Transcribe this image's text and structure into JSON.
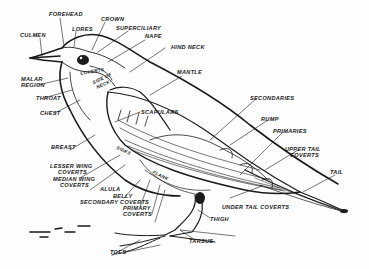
{
  "diagram": {
    "title": "",
    "line_color": "#1a1a1a",
    "background": "#fefefe",
    "labels": {
      "forehead": "FOREHEAD",
      "lores": "LORES",
      "crown": "CROWN",
      "culmen": "CULMEN",
      "superciliary": "SUPERCILIARY",
      "nape": "NAPE",
      "hind_neck": "HIND NECK",
      "ear_coverts": "COVERTS",
      "side_of_neck_1": "SIDE OF",
      "side_of_neck_2": "NECK",
      "mantle": "MANTLE",
      "malar_region_1": "MALAR",
      "malar_region_2": "REGION",
      "throat": "THROAT",
      "chest": "CHEST",
      "scapulars": "SCAPULARS",
      "secondaries": "SECONDARIES",
      "rump": "RUMP",
      "primaries": "PRIMARIES",
      "upper_tail_coverts_1": "UPPER TAIL",
      "upper_tail_coverts_2": "COVERTS",
      "tail": "TAIL",
      "breast": "BREAST",
      "lesser_wing_coverts_1": "LESSER WING",
      "lesser_wing_coverts_2": "COVERTS",
      "median_wing_coverts_1": "MEDIAN WING",
      "median_wing_coverts_2": "COVERTS",
      "sides": "SIDES",
      "flank": "FLANK",
      "alula": "ALULA",
      "belly": "BELLY",
      "secondary_coverts": "SECONDARY COVERTS",
      "primary_coverts_1": "PRIMARY",
      "primary_coverts_2": "COVERTS",
      "under_tail_coverts": "UNDER TAIL COVERTS",
      "thigh": "THIGH",
      "tarsus": "TARSUS",
      "toes": "TOES"
    }
  }
}
